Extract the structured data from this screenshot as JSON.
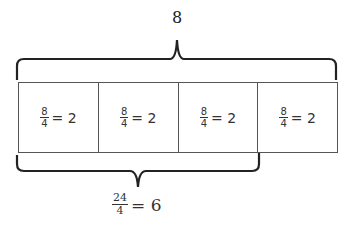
{
  "top_label": "8",
  "cells": [
    {
      "numerator": "8",
      "denominator": "4",
      "result": "= 2"
    },
    {
      "numerator": "8",
      "denominator": "4",
      "result": "= 2"
    },
    {
      "numerator": "8",
      "denominator": "4",
      "result": "= 2"
    },
    {
      "numerator": "8",
      "denominator": "4",
      "result": "= 2"
    }
  ],
  "bottom_label": {
    "numerator": "24",
    "denominator": "4",
    "result": "= 6"
  }
}
